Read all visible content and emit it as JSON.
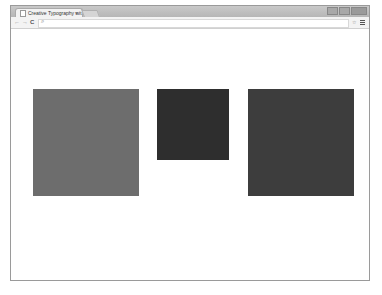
{
  "browser": {
    "tab": {
      "title": "Creative Typography wit",
      "close_glyph": "×",
      "icon": "page-icon"
    },
    "toolbar": {
      "back_glyph": "←",
      "forward_glyph": "→",
      "reload_glyph": "C",
      "omnibox_value": "",
      "search_glyph": "⌕",
      "star_glyph": "☆"
    }
  },
  "page": {
    "boxes": [
      {
        "name": "square-medium-gray",
        "color": "#6d6d6d"
      },
      {
        "name": "square-small-dark",
        "color": "#2e2e2e"
      },
      {
        "name": "square-large-dark",
        "color": "#3d3d3d"
      }
    ]
  }
}
